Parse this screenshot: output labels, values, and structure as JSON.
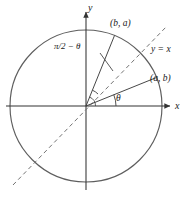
{
  "figure": {
    "background_color": "#ffffff",
    "stroke_color": "#4d4d4d",
    "text_color": "#1a1a1a",
    "width": 192,
    "height": 197
  },
  "axes": {
    "x_label": "x",
    "y_label": "y",
    "origin": {
      "x": 86,
      "y": 106
    },
    "x_axis_start": {
      "x": 6,
      "y": 106
    },
    "x_axis_end": {
      "x": 172,
      "y": 106
    },
    "y_axis_start": {
      "x": 86,
      "y": 190
    },
    "y_axis_end": {
      "x": 86,
      "y": 10
    },
    "arrowheads": "both-positive-ends"
  },
  "circle": {
    "center_x": 86,
    "center_y": 106,
    "radius": 76,
    "stroke": "#595959",
    "fill": "none",
    "line_style": "solid"
  },
  "identity_line": {
    "label": "y = x",
    "line_style": "dashed",
    "start": {
      "x": 13,
      "y": 185
    },
    "end": {
      "x": 167,
      "y": 26
    },
    "stroke": "#6b6b6b"
  },
  "points": [
    {
      "name": "point-ab",
      "label": "(a, b)",
      "angle_deg": 22,
      "circle_x": 156.5,
      "circle_y": 77.5,
      "description": "terminal point of angle theta"
    },
    {
      "name": "point-ba",
      "label": "(b, a)",
      "angle_deg": 68,
      "circle_x": 114.5,
      "circle_y": 35.5,
      "description": "terminal point of angle pi/2 minus theta, reflection of (a, b) across y = x"
    }
  ],
  "angles": [
    {
      "name": "angle-theta",
      "label": "θ",
      "from_deg": 0,
      "to_deg": 22,
      "arc_radius": 30,
      "label_x": 116,
      "label_y": 94
    },
    {
      "name": "angle-complement",
      "label": "π/2 − θ",
      "from_deg": 45,
      "to_deg": 68,
      "arc_radius": 17,
      "label_x": 54,
      "label_y": 42,
      "leader_from": {
        "x": 100,
        "y": 53
      },
      "leader_to": {
        "x": 112,
        "y": 70
      }
    }
  ],
  "radii": [
    {
      "name": "radius-to-ab",
      "to_x": 156.5,
      "to_y": 77.5
    },
    {
      "name": "radius-to-ba",
      "to_x": 114.5,
      "to_y": 35.5
    }
  ]
}
